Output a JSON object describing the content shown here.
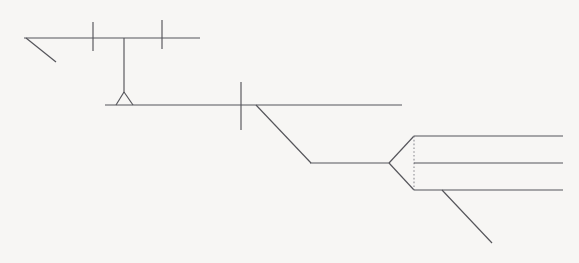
{
  "canvas": {
    "width": 579,
    "height": 263,
    "background_color": "#f7f6f4",
    "stroke_color": "#55555a",
    "dotted_stroke_color": "#8a8a90",
    "title": "Line schematic drawing"
  },
  "diagram": {
    "name": "beam-pivot-chevron-schematic",
    "groups": [
      {
        "name": "upper-beam-assembly",
        "label": "Upper beam assembly",
        "elements": [
          {
            "name": "upper-beam-line",
            "kind": "line",
            "x1": 24,
            "y1": 38,
            "x2": 200,
            "y2": 38,
            "style": "solid"
          },
          {
            "name": "upper-beam-left-diagonal",
            "kind": "line",
            "x1": 26,
            "y1": 38,
            "x2": 56,
            "y2": 62,
            "style": "solid"
          },
          {
            "name": "upper-beam-tick-one",
            "kind": "line",
            "x1": 93,
            "y1": 22,
            "x2": 93,
            "y2": 51,
            "style": "solid"
          },
          {
            "name": "upper-beam-tick-two",
            "kind": "line",
            "x1": 162,
            "y1": 20,
            "x2": 162,
            "y2": 49,
            "style": "solid"
          }
        ]
      },
      {
        "name": "hanger-and-pivot",
        "label": "Vertical hanger and triangular pivot",
        "elements": [
          {
            "name": "vertical-hanger-line",
            "kind": "line",
            "x1": 124,
            "y1": 38,
            "x2": 124,
            "y2": 93,
            "style": "solid"
          },
          {
            "name": "pivot-triangle-left-edge",
            "kind": "line",
            "x1": 124,
            "y1": 92,
            "x2": 116,
            "y2": 105,
            "style": "solid"
          },
          {
            "name": "pivot-triangle-right-edge",
            "kind": "line",
            "x1": 124,
            "y1": 92,
            "x2": 133,
            "y2": 105,
            "style": "solid"
          }
        ]
      },
      {
        "name": "middle-beam-assembly",
        "label": "Middle beam assembly",
        "elements": [
          {
            "name": "middle-beam-line",
            "kind": "line",
            "x1": 105,
            "y1": 105,
            "x2": 402,
            "y2": 105,
            "style": "solid"
          },
          {
            "name": "middle-beam-tick",
            "kind": "line",
            "x1": 241,
            "y1": 82,
            "x2": 241,
            "y2": 130,
            "style": "solid"
          },
          {
            "name": "middle-beam-descending-diagonal",
            "kind": "line",
            "x1": 256,
            "y1": 105,
            "x2": 311,
            "y2": 163,
            "style": "solid"
          }
        ]
      },
      {
        "name": "lower-run",
        "label": "Lower horizontal run into chevron node",
        "elements": [
          {
            "name": "lower-run-line",
            "kind": "line",
            "x1": 310,
            "y1": 163,
            "x2": 389,
            "y2": 163,
            "style": "solid"
          }
        ]
      },
      {
        "name": "chevron-node",
        "label": "Chevron arrowhead node",
        "elements": [
          {
            "name": "chevron-upper-edge",
            "kind": "line",
            "x1": 389,
            "y1": 163,
            "x2": 414,
            "y2": 136,
            "style": "solid"
          },
          {
            "name": "chevron-lower-edge",
            "kind": "line",
            "x1": 389,
            "y1": 163,
            "x2": 414,
            "y2": 190,
            "style": "solid"
          },
          {
            "name": "chevron-base-dotted-line",
            "kind": "line",
            "x1": 414,
            "y1": 136,
            "x2": 414,
            "y2": 190,
            "style": "dotted"
          }
        ]
      },
      {
        "name": "output-lines",
        "label": "Three parallel output lines",
        "elements": [
          {
            "name": "output-line-top",
            "kind": "line",
            "x1": 414,
            "y1": 136,
            "x2": 563,
            "y2": 136,
            "style": "solid"
          },
          {
            "name": "output-line-middle",
            "kind": "line",
            "x1": 414,
            "y1": 163,
            "x2": 563,
            "y2": 163,
            "style": "solid"
          },
          {
            "name": "output-line-bottom",
            "kind": "line",
            "x1": 414,
            "y1": 190,
            "x2": 563,
            "y2": 190,
            "style": "solid"
          },
          {
            "name": "output-tail-diagonal",
            "kind": "line",
            "x1": 442,
            "y1": 190,
            "x2": 492,
            "y2": 243,
            "style": "solid"
          }
        ]
      }
    ]
  }
}
